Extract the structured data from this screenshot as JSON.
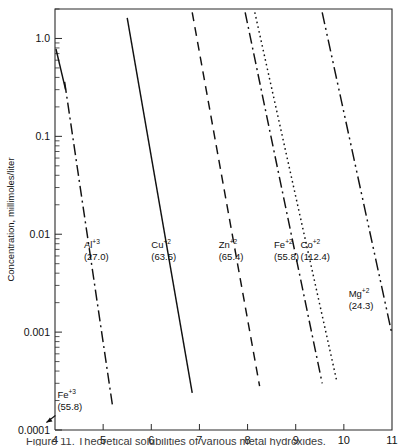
{
  "figure": {
    "background": "#ffffff",
    "line_color": "#111111",
    "axis_color": "#2b2b2b"
  },
  "chart_data": {
    "type": "line",
    "title": "",
    "subtitle": "",
    "xlabel": "",
    "ylabel": "Concentration, millimoles/liter",
    "xlim": [
      4,
      11
    ],
    "ylim": [
      0.0001,
      2.0
    ],
    "yscale": "log",
    "xscale": "linear",
    "grid": false,
    "legend": "inline-annotations",
    "xticks": [
      4,
      5,
      6,
      7,
      8,
      9,
      10,
      11
    ],
    "xtick_labels": [
      "4",
      "5",
      "6",
      "7",
      "8",
      "9",
      "10",
      "11"
    ],
    "yticks": [
      1.0,
      0.1,
      0.01,
      0.001,
      0.0001
    ],
    "ytick_labels": [
      "1.0",
      "0.1",
      "0.01",
      "0.001",
      "0.0001"
    ],
    "series": [
      {
        "name": "Fe+3",
        "ion": "Fe",
        "charge": "+3",
        "mass": "(55.8)",
        "linestyle": "solid",
        "x": [
          4.02,
          4.22
        ],
        "values": [
          0.78,
          0.3
        ],
        "label_x": 4.05,
        "label_y": 0.00021,
        "annotation_arrow": true
      },
      {
        "name": "Al+3",
        "ion": "Al",
        "charge": "+3",
        "mass": "(27.0)",
        "linestyle": "dashdot",
        "x": [
          4.2,
          5.2
        ],
        "values": [
          0.36,
          0.00017
        ],
        "label_x": 4.6,
        "label_y": 0.0072
      },
      {
        "name": "Cu+2",
        "ion": "Cu",
        "charge": "+2",
        "mass": "(63.5)",
        "linestyle": "solid",
        "x": [
          5.5,
          6.85
        ],
        "values": [
          1.62,
          0.00024
        ],
        "label_x": 6.0,
        "label_y": 0.0072
      },
      {
        "name": "Zn+2",
        "ion": "Zn",
        "charge": "+2",
        "mass": "(65.4)",
        "linestyle": "dashed",
        "x": [
          6.85,
          8.25
        ],
        "values": [
          1.85,
          0.00028
        ],
        "label_x": 7.4,
        "label_y": 0.0072
      },
      {
        "name": "Fe+2",
        "ion": "Fe",
        "charge": "+2",
        "mass": "(55.8)",
        "linestyle": "dashdot",
        "x": [
          7.95,
          9.55
        ],
        "values": [
          1.85,
          0.0003
        ],
        "label_x": 8.55,
        "label_y": 0.0072
      },
      {
        "name": "Co+2",
        "ion": "Co",
        "charge": "+2",
        "mass": "(112.4)",
        "linestyle": "dotted",
        "x": [
          8.15,
          9.85
        ],
        "values": [
          1.85,
          0.00032
        ],
        "label_x": 9.1,
        "label_y": 0.0072
      },
      {
        "name": "Mg+2",
        "ion": "Mg",
        "charge": "+2",
        "mass": "(24.3)",
        "linestyle": "dashdotdot",
        "x": [
          9.55,
          11.0
        ],
        "values": [
          1.85,
          0.00095
        ],
        "label_x": 10.1,
        "label_y": 0.0023
      }
    ]
  },
  "caption": {
    "text": "Figure 11. Theoretical solubilities of various metal hydroxides."
  }
}
